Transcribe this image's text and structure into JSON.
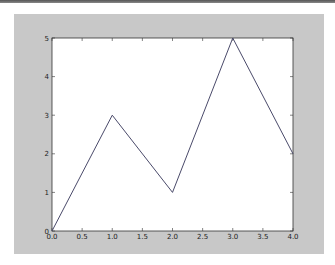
{
  "chart_data": {
    "type": "line",
    "title": "",
    "xlabel": "",
    "ylabel": "",
    "x": [
      0,
      1,
      2,
      3,
      4
    ],
    "series": [
      {
        "name": "line",
        "values": [
          0,
          3,
          1,
          5,
          2
        ],
        "color": "#4a4a6a"
      }
    ],
    "xlim": [
      0.0,
      4.0
    ],
    "ylim": [
      0,
      5
    ],
    "xticks": [
      "0.0",
      "0.5",
      "1.0",
      "1.5",
      "2.0",
      "2.5",
      "3.0",
      "3.5",
      "4.0"
    ],
    "yticks": [
      "0",
      "1",
      "2",
      "3",
      "4",
      "5"
    ],
    "grid": false,
    "legend": null
  },
  "colors": {
    "figure_bg": "#c8c8c8",
    "axes_bg": "#ffffff",
    "line": "#4a4a6a"
  }
}
